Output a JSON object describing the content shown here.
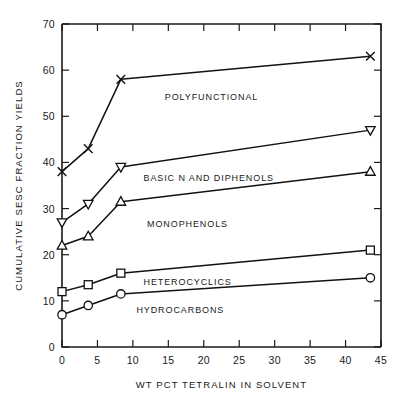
{
  "chart_data": {
    "type": "line",
    "title": "",
    "xlabel": "WT PCT TETRALIN IN SOLVENT",
    "ylabel": "CUMULATIVE SESC FRACTION YIELDS",
    "xlim": [
      0,
      45
    ],
    "ylim": [
      0,
      70
    ],
    "xticks": [
      0,
      5,
      10,
      15,
      20,
      25,
      30,
      35,
      40,
      45
    ],
    "xticklabels": [
      "0",
      "5",
      "10",
      "15",
      "20",
      "25",
      "30",
      "35",
      "40",
      "45"
    ],
    "yticks": [
      0,
      10,
      20,
      30,
      40,
      50,
      60,
      70
    ],
    "yticklabels": [
      "0",
      "10",
      "20",
      "30",
      "40",
      "50",
      "60",
      "70"
    ],
    "grid": false,
    "legend_position": "inline-annotations",
    "x": [
      0,
      3.7,
      8.3,
      43.5
    ],
    "series": [
      {
        "name": "POLYFUNCTIONAL",
        "marker": "x",
        "values": [
          38,
          43,
          58,
          63
        ],
        "label_x": 14.5,
        "label_y": 53.5
      },
      {
        "name": "BASIC N AND DIPHENOLS",
        "marker": "triangle-down",
        "values": [
          27,
          31,
          39,
          47
        ],
        "label_x": 11.5,
        "label_y": 36.0
      },
      {
        "name": "MONOPHENOLS",
        "marker": "triangle-up",
        "values": [
          22,
          24,
          31.5,
          38
        ],
        "label_x": 12.0,
        "label_y": 26.0
      },
      {
        "name": "HETEROCYCLICS",
        "marker": "square",
        "values": [
          12,
          13.5,
          16,
          21
        ],
        "label_x": 11.5,
        "label_y": 13.5
      },
      {
        "name": "HYDROCARBONS",
        "marker": "circle",
        "values": [
          7,
          9,
          11.5,
          15
        ],
        "label_x": 10.5,
        "label_y": 7.3
      }
    ]
  }
}
